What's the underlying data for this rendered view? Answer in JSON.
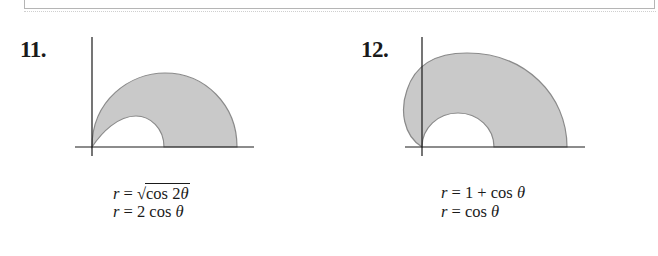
{
  "problems": [
    {
      "number": "11.",
      "equations": [
        {
          "lhs": "r",
          "eq": " = ",
          "sqrt_symbol": "√",
          "rhs": "cos 2",
          "theta": "θ"
        },
        {
          "lhs": "r",
          "eq": " = ",
          "rhs": "2 cos ",
          "theta": "θ"
        }
      ],
      "figure": {
        "description": "shaded region inside r = 2cosθ... outer lobe, outside inner lemniscate lobe, first quadrant",
        "fill_color": "#c8c8c8",
        "stroke_color": "#8a8a8a"
      }
    },
    {
      "number": "12.",
      "equations": [
        {
          "lhs": "r",
          "eq": " = ",
          "rhs": "1 + cos ",
          "theta": "θ"
        },
        {
          "lhs": "r",
          "eq": " = ",
          "rhs": "cos ",
          "theta": "θ"
        }
      ],
      "figure": {
        "description": "shaded region inside cardioid r = 1 + cosθ, outside circle r = cosθ, upper half-plane",
        "fill_color": "#c8c8c8",
        "stroke_color": "#8a8a8a"
      }
    }
  ],
  "colors": {
    "axis": "#1a1a1a",
    "shade": "#c8c8c8",
    "outline": "#8a8a8a",
    "box_border": "#b5b5b5"
  }
}
